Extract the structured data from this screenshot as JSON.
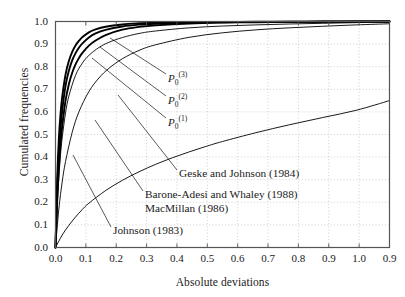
{
  "chart_data": {
    "type": "line",
    "title": "",
    "xlabel": "Absolute deviations",
    "ylabel": "Cumulated frequencies",
    "xlim": [
      0.0,
      1.0
    ],
    "ylim": [
      0.0,
      1.0
    ],
    "grid": true,
    "legend_position": "inline-annotations",
    "xticks": [
      "0.0",
      "0.1",
      "0.2",
      "0.3",
      "0.4",
      "0.5",
      "0.6",
      "0.7",
      "0.8",
      "0.9",
      "1.0",
      "0.9",
      "1.0"
    ],
    "yticks": [
      "0.0",
      "0.1",
      "0.2",
      "0.3",
      "0.4",
      "0.5",
      "0.6",
      "0.7",
      "0.8",
      "0.9",
      "1.0"
    ],
    "series": [
      {
        "name": "P0(3)",
        "label": "P0^(3)",
        "weight": "thick",
        "x": [
          0.0,
          0.005,
          0.01,
          0.015,
          0.02,
          0.03,
          0.04,
          0.05,
          0.06,
          0.07,
          0.08,
          0.1,
          0.12,
          0.15,
          0.2,
          0.25,
          0.3,
          0.4,
          0.5,
          0.6,
          0.7,
          0.8,
          0.9,
          1.0
        ],
        "values": [
          0.0,
          0.3,
          0.48,
          0.59,
          0.665,
          0.765,
          0.825,
          0.866,
          0.894,
          0.914,
          0.93,
          0.952,
          0.965,
          0.977,
          0.987,
          0.992,
          0.995,
          0.997,
          0.998,
          0.999,
          0.999,
          1.0,
          1.0,
          1.0
        ]
      },
      {
        "name": "P0(2)",
        "label": "P0^(2)",
        "weight": "thick",
        "x": [
          0.0,
          0.005,
          0.01,
          0.015,
          0.02,
          0.03,
          0.04,
          0.05,
          0.06,
          0.07,
          0.08,
          0.1,
          0.12,
          0.15,
          0.2,
          0.25,
          0.3,
          0.4,
          0.5,
          0.6,
          0.7,
          0.8,
          0.9,
          1.0
        ],
        "values": [
          0.0,
          0.25,
          0.415,
          0.525,
          0.605,
          0.715,
          0.782,
          0.828,
          0.86,
          0.884,
          0.902,
          0.929,
          0.947,
          0.963,
          0.978,
          0.986,
          0.99,
          0.995,
          0.997,
          0.998,
          0.999,
          0.999,
          1.0,
          1.0
        ]
      },
      {
        "name": "P0(1)",
        "label": "P0^(1)",
        "weight": "thick",
        "x": [
          0.0,
          0.005,
          0.01,
          0.015,
          0.02,
          0.03,
          0.04,
          0.05,
          0.06,
          0.07,
          0.08,
          0.1,
          0.12,
          0.15,
          0.2,
          0.25,
          0.3,
          0.4,
          0.5,
          0.6,
          0.7,
          0.8,
          0.9,
          1.0
        ],
        "values": [
          0.0,
          0.205,
          0.35,
          0.455,
          0.535,
          0.65,
          0.722,
          0.773,
          0.81,
          0.838,
          0.86,
          0.893,
          0.916,
          0.94,
          0.964,
          0.976,
          0.983,
          0.991,
          0.995,
          0.997,
          0.998,
          0.999,
          0.999,
          1.0
        ]
      },
      {
        "name": "Geske and Johnson (1984)",
        "label": "Geske and Johnson (1984)",
        "weight": "thin",
        "x": [
          0.0,
          0.01,
          0.02,
          0.03,
          0.05,
          0.07,
          0.1,
          0.13,
          0.16,
          0.2,
          0.25,
          0.3,
          0.4,
          0.5,
          0.6,
          0.7,
          0.8,
          0.9,
          1.0
        ],
        "values": [
          0.0,
          0.17,
          0.29,
          0.38,
          0.51,
          0.6,
          0.69,
          0.75,
          0.793,
          0.835,
          0.872,
          0.897,
          0.93,
          0.95,
          0.963,
          0.972,
          0.979,
          0.985,
          0.99
        ]
      },
      {
        "name": "Barone-Adesi and Whaley (1988) / MacMillan (1986)",
        "label": "Barone-Adesi and Whaley (1988)",
        "label2": "MacMillan (1986)",
        "weight": "thin",
        "x": [
          0.0,
          0.005,
          0.01,
          0.015,
          0.02,
          0.03,
          0.04,
          0.06,
          0.08,
          0.1,
          0.13,
          0.16,
          0.2,
          0.25,
          0.3,
          0.4,
          0.5,
          0.6,
          0.7,
          0.8,
          0.9,
          1.0
        ],
        "values": [
          0.0,
          0.18,
          0.31,
          0.41,
          0.485,
          0.595,
          0.67,
          0.762,
          0.815,
          0.85,
          0.885,
          0.908,
          0.929,
          0.947,
          0.958,
          0.972,
          0.98,
          0.985,
          0.989,
          0.992,
          0.995,
          0.997
        ]
      },
      {
        "name": "Johnson (1983)",
        "label": "Johnson (1983)",
        "weight": "thin",
        "x": [
          0.0,
          0.02,
          0.04,
          0.06,
          0.08,
          0.1,
          0.15,
          0.2,
          0.25,
          0.3,
          0.35,
          0.4,
          0.45,
          0.5,
          0.6,
          0.7,
          0.8,
          0.9,
          1.0
        ],
        "values": [
          0.0,
          0.055,
          0.098,
          0.135,
          0.168,
          0.196,
          0.252,
          0.297,
          0.335,
          0.368,
          0.397,
          0.423,
          0.447,
          0.469,
          0.508,
          0.543,
          0.575,
          0.607,
          0.65
        ]
      }
    ],
    "annotations": [
      {
        "name": "p0-3-label",
        "text": "P"
      },
      {
        "name": "p0-2-label",
        "text": "P"
      },
      {
        "name": "p0-1-label",
        "text": "P"
      }
    ]
  },
  "labels": {
    "p0_base": "P",
    "p0_sub": "0",
    "p0_sup3": "(3)",
    "p0_sup2": "(2)",
    "p0_sup1": "(1)",
    "geske": "Geske and Johnson (1984)",
    "barone": "Barone-Adesi and Whaley (1988)",
    "macmillan": "MacMillan (1986)",
    "johnson": "Johnson (1983)"
  },
  "colors": {
    "curve": "#000000",
    "grid": "#bbbbbb",
    "frame": "#555555",
    "text": "#1a1a1a"
  }
}
